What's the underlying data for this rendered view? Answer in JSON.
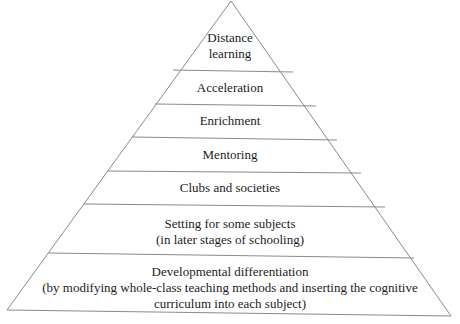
{
  "diagram": {
    "type": "pyramid",
    "line_color": "#8a8a8a",
    "text_color": "#1c1c1c",
    "tiers": [
      {
        "lines": [
          "Distance",
          "learning"
        ]
      },
      {
        "lines": [
          "Acceleration"
        ]
      },
      {
        "lines": [
          "Enrichment"
        ]
      },
      {
        "lines": [
          "Mentoring"
        ]
      },
      {
        "lines": [
          "Clubs and societies"
        ]
      },
      {
        "lines": [
          "Setting for some subjects",
          "(in later stages of schooling)"
        ]
      },
      {
        "lines": [
          "Developmental differentiation",
          "(by modifying whole-class teaching methods and inserting the cognitive",
          "curriculum into each subject)"
        ]
      }
    ]
  }
}
